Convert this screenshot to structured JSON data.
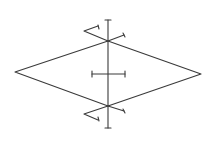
{
  "diagram": {
    "type": "geometric-construction",
    "colors": {
      "background": "#ffffff",
      "stroke": "#3a3a3a"
    },
    "rhombus": {
      "left_vertex": [
        15,
        72
      ],
      "top_vertex": [
        108,
        41
      ],
      "right_vertex": [
        201,
        74
      ],
      "bottom_vertex": [
        108,
        106
      ]
    },
    "vertical_line": {
      "x": 108,
      "y1": 20,
      "y2": 128,
      "tick_half_width": 3
    },
    "horizontal_segment": {
      "y": 74,
      "x1": 92,
      "x2": 125,
      "tick_half_height": 3
    },
    "construction_marks": {
      "top_left": [
        [
          108,
          41
        ],
        [
          84,
          31
        ],
        [
          98,
          26
        ]
      ],
      "top_right": [
        [
          108,
          41
        ],
        [
          124,
          35
        ]
      ],
      "bottom_left": [
        [
          108,
          106
        ],
        [
          84,
          114
        ],
        [
          98,
          120
        ]
      ],
      "bottom_right": [
        [
          108,
          106
        ],
        [
          124,
          111
        ]
      ]
    }
  }
}
